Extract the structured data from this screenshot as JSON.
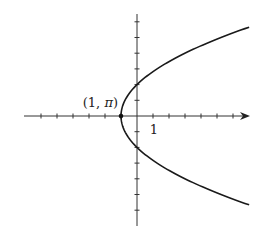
{
  "chart_data": {
    "type": "line",
    "title": "",
    "xlabel": "",
    "ylabel": "",
    "equation_cartesian": "x = y^2/4 - 1",
    "xlim": [
      -7,
      7
    ],
    "ylim": [
      -7,
      7
    ],
    "x_ticks": [
      -6,
      -5,
      -4,
      -3,
      -2,
      -1,
      1,
      2,
      3,
      4,
      5,
      6
    ],
    "y_ticks": [
      -6,
      -5,
      -4,
      -3,
      -2,
      -1,
      1,
      2,
      3,
      4,
      5,
      6
    ],
    "tick_labels": [
      {
        "x": 1,
        "y": 0,
        "text": "1"
      }
    ],
    "grid": false,
    "x_axis_arrow": true,
    "series": [
      {
        "name": "parabola",
        "y_range": [
          -5.66,
          5.66
        ],
        "points": [
          {
            "x": 7,
            "y": 5.66
          },
          {
            "x": 3,
            "y": 4
          },
          {
            "x": 1.25,
            "y": 3
          },
          {
            "x": 0,
            "y": 2
          },
          {
            "x": -0.75,
            "y": 1
          },
          {
            "x": -1,
            "y": 0
          },
          {
            "x": -0.75,
            "y": -1
          },
          {
            "x": 0,
            "y": -2
          },
          {
            "x": 1.25,
            "y": -3
          },
          {
            "x": 3,
            "y": -4
          },
          {
            "x": 7,
            "y": -5.66
          }
        ]
      }
    ],
    "annotations": [
      {
        "x": -1,
        "y": 0,
        "text_prefix": "(1, ",
        "text_symbol": "π",
        "text_suffix": ")",
        "marker": "dot"
      }
    ]
  }
}
